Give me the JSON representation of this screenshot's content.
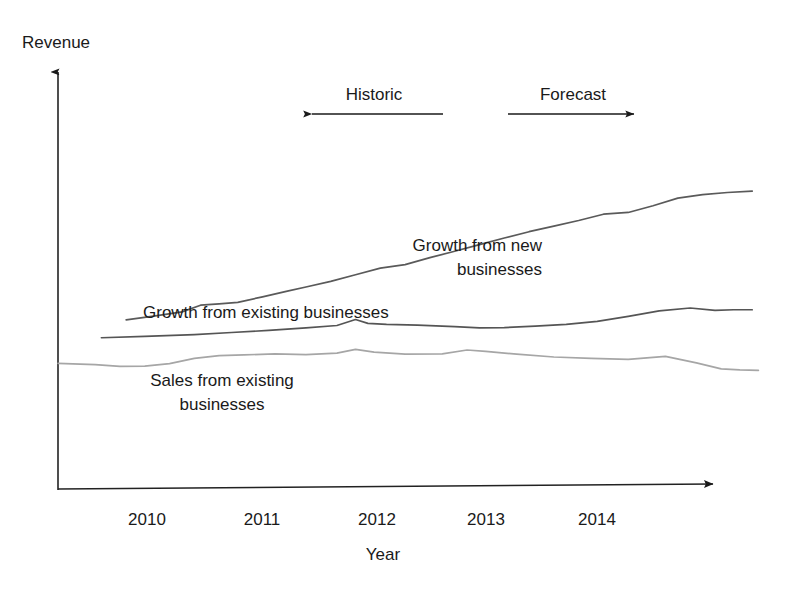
{
  "axes": {
    "y_title": "Revenue",
    "x_title": "Year"
  },
  "phases": {
    "historic_label": "Historic",
    "forecast_label": "Forecast"
  },
  "series_labels": {
    "new_line1": "Growth from new",
    "new_line2": "businesses",
    "existing_growth": "Growth from existing businesses",
    "sales_line1": "Sales from existing",
    "sales_line2": "businesses"
  },
  "ticks": {
    "t0": "2010",
    "t1": "2011",
    "t2": "2012",
    "t3": "2013",
    "t4": "2014"
  },
  "colors": {
    "axis": "#222222",
    "growth_new": "#5a5a5a",
    "growth_existing": "#555555",
    "sales_existing": "#a6a6a6",
    "text": "#1a1a1a",
    "background": "#ffffff"
  },
  "chart_data": {
    "type": "line",
    "title": "",
    "subtitle": "",
    "xlabel": "Year",
    "ylabel": "Revenue",
    "grid": false,
    "legend": "inline-annotations",
    "axis_style": "arrow-axes (no numeric y scale)",
    "xlim": [
      2009.6,
      2015.4
    ],
    "ylim": [
      0,
      100
    ],
    "x_tick_labels": [
      "2010",
      "2011",
      "2012",
      "2013",
      "2014"
    ],
    "x_ticks": [
      2010,
      2011,
      2012,
      2013,
      2014
    ],
    "y_tick_labels": [],
    "annotations": [
      {
        "text": "Historic",
        "type": "phase-range",
        "arrow": "left",
        "x_from": 2012.1,
        "x_to": 2010.8
      },
      {
        "text": "Forecast",
        "type": "phase-range",
        "arrow": "right",
        "x_from": 2013.3,
        "x_to": 2014.5
      },
      {
        "text": "Growth from new businesses",
        "type": "series-label"
      },
      {
        "text": "Growth from existing businesses",
        "type": "series-label"
      },
      {
        "text": "Sales from existing businesses",
        "type": "series-label"
      }
    ],
    "note": "Stacked cumulative-style bands: top boundary = total incl. growth from new businesses; middle boundary = total incl. growth from existing businesses; bottom boundary = sales from existing businesses. Values are relative revenue units read off the plot (y-axis unlabeled).",
    "series": [
      {
        "name": "Growth from new businesses",
        "color": "#5a5a5a",
        "x": [
          2010.15,
          2010.4,
          2010.6,
          2010.75,
          2010.9,
          2011.05,
          2011.25,
          2011.45,
          2011.6,
          2011.8,
          2012.0,
          2012.2,
          2012.4,
          2012.6,
          2012.8,
          2013.0,
          2013.2,
          2013.4,
          2013.6,
          2013.8,
          2014.0,
          2014.2,
          2014.4,
          2014.6,
          2014.8,
          2015.0,
          2015.2
        ],
        "values": [
          48.6,
          49.8,
          50.9,
          52.8,
          53.2,
          53.6,
          55.2,
          56.8,
          58.0,
          59.6,
          61.5,
          63.4,
          64.4,
          66.4,
          68.2,
          70.1,
          72.0,
          73.8,
          75.4,
          77.0,
          78.8,
          79.3,
          81.2,
          83.4,
          84.4,
          85.0,
          85.4
        ]
      },
      {
        "name": "Growth from existing businesses",
        "color": "#555555",
        "x": [
          2009.95,
          2010.3,
          2010.7,
          2011.0,
          2011.3,
          2011.6,
          2011.85,
          2012.0,
          2012.1,
          2012.25,
          2012.5,
          2012.8,
          2013.0,
          2013.2,
          2013.45,
          2013.7,
          2013.95,
          2014.2,
          2014.45,
          2014.7,
          2014.9,
          2015.05,
          2015.2
        ],
        "values": [
          43.5,
          43.9,
          44.4,
          45.0,
          45.6,
          46.3,
          47.0,
          48.7,
          47.6,
          47.3,
          47.1,
          46.7,
          46.3,
          46.4,
          46.8,
          47.3,
          48.2,
          49.6,
          51.2,
          52.0,
          51.3,
          51.5,
          51.5
        ]
      },
      {
        "name": "Sales from existing businesses",
        "color": "#a6a6a6",
        "x": [
          2009.6,
          2009.9,
          2010.1,
          2010.3,
          2010.5,
          2010.7,
          2010.9,
          2011.1,
          2011.35,
          2011.6,
          2011.85,
          2012.0,
          2012.15,
          2012.4,
          2012.7,
          2012.9,
          2013.05,
          2013.3,
          2013.6,
          2013.9,
          2014.2,
          2014.5,
          2014.75,
          2014.95,
          2015.1,
          2015.25
        ],
        "values": [
          36.2,
          35.8,
          35.3,
          35.4,
          36.1,
          37.6,
          38.4,
          38.6,
          38.9,
          38.7,
          39.1,
          40.2,
          39.4,
          38.8,
          38.9,
          40.0,
          39.6,
          38.8,
          38.0,
          37.6,
          37.3,
          38.2,
          36.3,
          34.6,
          34.3,
          34.2
        ]
      }
    ]
  }
}
